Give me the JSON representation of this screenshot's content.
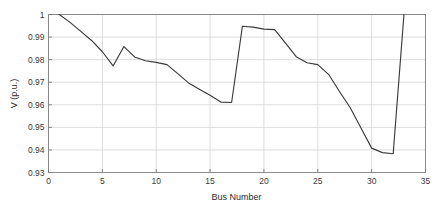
{
  "chart_data": {
    "type": "line",
    "title": "",
    "xlabel": "Bus Number",
    "ylabel": "V (p.u.)",
    "xlim": [
      0,
      35
    ],
    "ylim": [
      0.93,
      1
    ],
    "xticks": [
      0,
      5,
      10,
      15,
      20,
      25,
      30,
      35
    ],
    "xticklabels": [
      "0",
      "5",
      "10",
      "15",
      "20",
      "25",
      "30",
      "35"
    ],
    "yticks": [
      0.93,
      0.94,
      0.95,
      0.96,
      0.97,
      0.98,
      0.99,
      1
    ],
    "yticklabels": [
      "0.93",
      "0.94",
      "0.95",
      "0.96",
      "0.97",
      "0.98",
      "0.99",
      "1"
    ],
    "grid": true,
    "legend": "none",
    "line_color": "#3b3b3b",
    "grid_color": "#d4d4d4",
    "axis_color": "#7a7a7a",
    "background_color": "#ffffff",
    "series": [
      {
        "name": "Bus Voltage",
        "x": [
          1,
          2,
          3,
          4,
          5,
          6,
          7,
          8,
          9,
          10,
          11,
          12,
          13,
          14,
          15,
          16,
          17,
          18,
          19,
          20,
          21,
          22,
          23,
          24,
          25,
          26,
          27,
          28,
          29,
          30,
          31,
          32,
          33
        ],
        "values": [
          1.0,
          0.9965,
          0.9925,
          0.9885,
          0.9835,
          0.9772,
          0.9858,
          0.9812,
          0.9795,
          0.9788,
          0.9778,
          0.9738,
          0.9697,
          0.9669,
          0.9642,
          0.9612,
          0.961,
          0.9948,
          0.9944,
          0.9935,
          0.9933,
          0.9873,
          0.9813,
          0.9786,
          0.9778,
          0.9735,
          0.966,
          0.9588,
          0.9498,
          0.9408,
          0.9388,
          0.9383,
          1.0
        ]
      }
    ]
  },
  "axes": {
    "x_label": "Bus Number",
    "y_label": "V (p.u.)"
  }
}
